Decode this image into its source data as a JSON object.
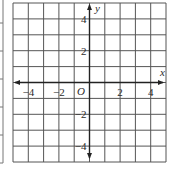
{
  "diagram": {
    "type": "coordinate-grid",
    "grid": {
      "x_range": [
        -5,
        5
      ],
      "y_range": [
        -5,
        5
      ],
      "cells_x": 10,
      "cells_y": 10,
      "line_color": "#555555",
      "axis_color": "#222222"
    },
    "axes": {
      "x_label": "x",
      "y_label": "y",
      "origin_label": "O"
    },
    "x_ticks": [
      {
        "value": -4,
        "label": "−4"
      },
      {
        "value": -2,
        "label": "−2"
      },
      {
        "value": 2,
        "label": "2"
      },
      {
        "value": 4,
        "label": "4"
      }
    ],
    "y_ticks": [
      {
        "value": 4,
        "label": "4"
      },
      {
        "value": 2,
        "label": "2"
      },
      {
        "value": -2,
        "label": "−2"
      },
      {
        "value": -4,
        "label": "−4"
      }
    ],
    "left_strip": {
      "tick_ys": [
        23,
        51,
        79,
        107,
        135,
        163
      ]
    }
  }
}
